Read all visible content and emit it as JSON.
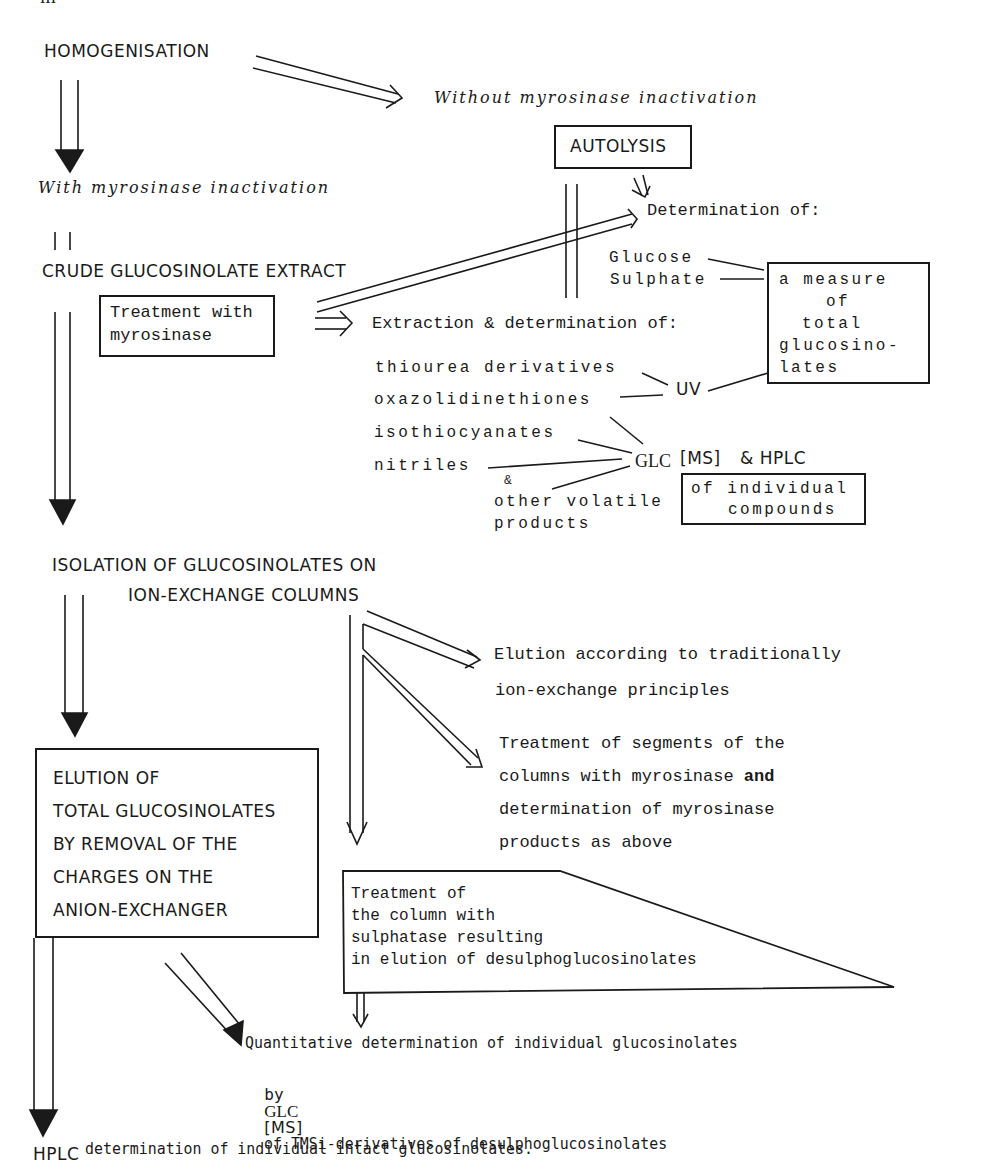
{
  "page_number": "III",
  "nodes": {
    "homogenisation": "HOMOGENISATION",
    "without_inactivation": "Without myrosinase inactivation",
    "with_inactivation": "With myrosinase inactivation",
    "autolysis": "AUTOLYSIS",
    "determination_of": "Determination of:",
    "glucose": "Glucose",
    "sulphate": "Sulphate",
    "measure_box": [
      "a measure",
      "of",
      "total",
      "glucosino-",
      "lates"
    ],
    "crude_extract": "CRUDE GLUCOSINOLATE EXTRACT",
    "treatment_myrosinase": [
      "Treatment with",
      "myrosinase"
    ],
    "extraction_determination": "Extraction & determination of:",
    "thiourea": "thiourea derivatives",
    "oxazolidinethiones": "oxazolidinethiones",
    "isothiocyanates": "isothiocyanates",
    "nitriles": "nitriles",
    "ampersand": "&",
    "other_volatile": [
      "other volatile",
      "products"
    ],
    "uv": "UV",
    "glc": "GLC",
    "ms": "MS",
    "and_hplc": "& HPLC",
    "individual_box": [
      "of individual",
      "compounds"
    ],
    "isolation": [
      "ISOLATION OF GLUCOSINOLATES ON",
      "ION-EXCHANGE COLUMNS"
    ],
    "elution_traditional": [
      "Elution according to traditionally",
      "ion-exchange principles"
    ],
    "treatment_segments": [
      "Treatment of segments of the",
      "columns with myrosinase and",
      "determination of myrosinase",
      "products as above"
    ],
    "elution_total_box": [
      "ELUTION OF",
      "TOTAL GLUCOSINOLATES",
      "BY REMOVAL OF THE",
      "CHARGES ON THE",
      "ANION-EXCHANGER"
    ],
    "sulphatase_box": [
      "Treatment of",
      "the column with",
      "sulphatase resulting",
      "in elution of desulphoglucosinolates"
    ],
    "quantitative": [
      "Quantitative determination of individual glucosinolates",
      "by",
      "GLC",
      "MS",
      "of TMSi-derivatives of desulphoglucosinolates"
    ],
    "hplc_final_prefix": "HPLC",
    "hplc_final": "determination of individual intact glucosinolates."
  }
}
